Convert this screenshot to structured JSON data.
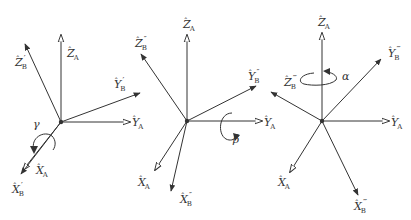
{
  "diagram": {
    "colors": {
      "stroke": "#333333",
      "background": "#ffffff"
    },
    "frames": [
      {
        "id": "frame-1",
        "origin": [
          61,
          122
        ],
        "rotation": {
          "symbol": "γ",
          "about": "X_A",
          "label_pos": [
            33,
            128
          ]
        },
        "axes": [
          {
            "id": "z-a",
            "to": [
              61,
              35
            ],
            "head": "hollow",
            "base": "Z",
            "sub": "A",
            "prime": "",
            "label_pos": [
              67,
              57
            ]
          },
          {
            "id": "z-b",
            "to": [
              25,
              44
            ],
            "head": "filled",
            "base": "Z",
            "sub": "B",
            "prime": "′",
            "label_pos": [
              15,
              66
            ]
          },
          {
            "id": "y-b",
            "to": [
              140,
              93
            ],
            "head": "filled",
            "base": "Y",
            "sub": "B",
            "prime": "′",
            "label_pos": [
              114,
              88
            ]
          },
          {
            "id": "y-a",
            "to": [
              130,
              122
            ],
            "head": "hollow",
            "base": "Y",
            "sub": "A",
            "prime": "",
            "label_pos": [
              132,
              126
            ]
          },
          {
            "id": "x-a",
            "to": [
              23,
              170
            ],
            "head": "hollow",
            "base": "X",
            "sub": "A",
            "prime": "",
            "label_pos": [
              36,
              174
            ]
          },
          {
            "id": "x-b",
            "to": [
              21,
              174
            ],
            "head": "filled",
            "base": "X",
            "sub": "B",
            "prime": "′",
            "label_pos": [
              12,
              193
            ]
          }
        ]
      },
      {
        "id": "frame-2",
        "origin": [
          187,
          121
        ],
        "rotation": {
          "symbol": "β",
          "about": "Y_A",
          "label_pos": [
            233,
            143
          ]
        },
        "axes": [
          {
            "id": "z-a",
            "to": [
              187,
              35
            ],
            "head": "hollow",
            "base": "Z",
            "sub": "A",
            "prime": "",
            "label_pos": [
              183,
              28
            ]
          },
          {
            "id": "z-b",
            "to": [
              141,
              54
            ],
            "head": "filled",
            "base": "Z",
            "sub": "B",
            "prime": "″",
            "label_pos": [
              135,
              47
            ]
          },
          {
            "id": "y-b",
            "to": [
              256,
              86
            ],
            "head": "filled",
            "base": "Y",
            "sub": "B",
            "prime": "″",
            "label_pos": [
              248,
              80
            ]
          },
          {
            "id": "y-a",
            "to": [
              262,
              121
            ],
            "head": "hollow",
            "base": "Y",
            "sub": "A",
            "prime": "",
            "label_pos": [
              264,
              126
            ]
          },
          {
            "id": "x-a",
            "to": [
              155,
              170
            ],
            "head": "hollow",
            "base": "X",
            "sub": "A",
            "prime": "",
            "label_pos": [
              138,
              186
            ]
          },
          {
            "id": "x-b",
            "to": [
              171,
              191
            ],
            "head": "filled",
            "base": "X",
            "sub": "B",
            "prime": "″",
            "label_pos": [
              180,
              203
            ]
          }
        ]
      },
      {
        "id": "frame-3",
        "origin": [
          322,
          121
        ],
        "rotation": {
          "symbol": "α",
          "about": "Z_A",
          "label_pos": [
            342,
            80
          ]
        },
        "axes": [
          {
            "id": "z-a",
            "to": [
              322,
              33
            ],
            "head": "hollow",
            "base": "Z",
            "sub": "A",
            "prime": "",
            "label_pos": [
              318,
              26
            ]
          },
          {
            "id": "z-b",
            "to": [
              271,
              92
            ],
            "head": "filled",
            "base": "Z",
            "sub": "B",
            "prime": "‴",
            "label_pos": [
              284,
              86
            ]
          },
          {
            "id": "y-b",
            "to": [
              381,
              59
            ],
            "head": "filled",
            "base": "Y",
            "sub": "B",
            "prime": "‴",
            "label_pos": [
              388,
              57
            ]
          },
          {
            "id": "y-a",
            "to": [
              389,
              121
            ],
            "head": "hollow",
            "base": "Y",
            "sub": "A",
            "prime": "",
            "label_pos": [
              391,
              126
            ]
          },
          {
            "id": "x-a",
            "to": [
              290,
              172
            ],
            "head": "hollow",
            "base": "X",
            "sub": "A",
            "prime": "",
            "label_pos": [
              278,
              186
            ]
          },
          {
            "id": "x-b",
            "to": [
              358,
              195
            ],
            "head": "filled",
            "base": "X",
            "sub": "B",
            "prime": "‴",
            "label_pos": [
              354,
              210
            ]
          }
        ]
      }
    ]
  }
}
